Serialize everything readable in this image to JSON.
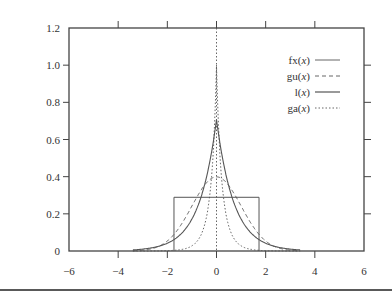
{
  "chart_data": {
    "type": "line",
    "title": "",
    "xlabel": "",
    "ylabel": "",
    "xlim": [
      -6,
      6
    ],
    "ylim": [
      0,
      1.2
    ],
    "x_ticks": [
      "-6",
      "-4",
      "-2",
      "0",
      "2",
      "4",
      "6"
    ],
    "y_ticks": [
      "0",
      "0.2",
      "0.4",
      "0.6",
      "0.8",
      "1.0",
      "1.2"
    ],
    "grid": false,
    "legend_position": "upper right",
    "series": [
      {
        "name": "fx(x)",
        "style": "solid-thin",
        "kind": "uniform",
        "description": "rectangle from x=-1.73 to 1.73 at height 0.289",
        "x": [
          -6,
          -1.73,
          -1.73,
          1.73,
          1.73,
          6
        ],
        "values": [
          0,
          0,
          0.289,
          0.289,
          0,
          0
        ]
      },
      {
        "name": "gu(x)",
        "style": "dashed",
        "kind": "gaussian",
        "peak": 0.399,
        "x": [
          -4,
          -3,
          -2,
          -1,
          0,
          1,
          2,
          3,
          4
        ],
        "values": [
          0.0001,
          0.004,
          0.054,
          0.242,
          0.399,
          0.242,
          0.054,
          0.004,
          0.0001
        ]
      },
      {
        "name": "l(x)",
        "style": "solid",
        "kind": "laplace",
        "peak": 0.707,
        "x": [
          -4,
          -3,
          -2,
          -1,
          0,
          1,
          2,
          3,
          4
        ],
        "values": [
          0.002,
          0.01,
          0.042,
          0.172,
          0.707,
          0.172,
          0.042,
          0.01,
          0.002
        ]
      },
      {
        "name": "ga(x)",
        "style": "dotted",
        "kind": "sharp-peaked",
        "peak": 1.0,
        "x": [
          -4,
          -3,
          -2,
          -1,
          0,
          1,
          2,
          3,
          4
        ],
        "values": [
          0.001,
          0.006,
          0.03,
          0.11,
          1.0,
          0.11,
          0.03,
          0.006,
          0.001
        ]
      }
    ],
    "annotations": [
      "vertical dotted line at x=0"
    ]
  },
  "axes": {
    "x_ticks": [
      {
        "label": "−6",
        "value": -6
      },
      {
        "label": "−4",
        "value": -4
      },
      {
        "label": "−2",
        "value": -2
      },
      {
        "label": "0",
        "value": 0
      },
      {
        "label": "2",
        "value": 2
      },
      {
        "label": "4",
        "value": 4
      },
      {
        "label": "6",
        "value": 6
      }
    ],
    "y_ticks": [
      {
        "label": "0",
        "value": 0
      },
      {
        "label": "0.2",
        "value": 0.2
      },
      {
        "label": "0.4",
        "value": 0.4
      },
      {
        "label": "0.6",
        "value": 0.6
      },
      {
        "label": "0.8",
        "value": 0.8
      },
      {
        "label": "1.0",
        "value": 1.0
      },
      {
        "label": "1.2",
        "value": 1.2
      }
    ]
  },
  "legend": [
    {
      "label": "fx(x)",
      "style": "solid-thin"
    },
    {
      "label": "gu(x)",
      "style": "dashed"
    },
    {
      "label": "l(x)",
      "style": "solid"
    },
    {
      "label": "ga(x)",
      "style": "dotted"
    }
  ],
  "colors": {
    "line": "#555555",
    "axis": "#444444",
    "text": "#333333"
  }
}
